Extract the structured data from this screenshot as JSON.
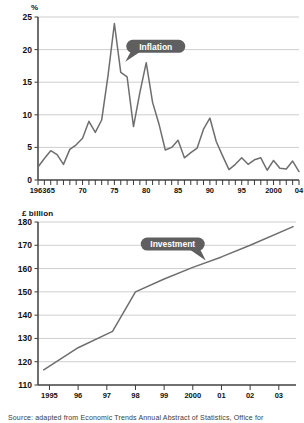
{
  "source_note": "Source: adapted from Economic Trends Annual Abstract of Statistics, Office for",
  "charts": {
    "inflation": {
      "unit_label": "%",
      "callout": "Inflation",
      "axis": {
        "y_ticks": [
          "0",
          "5",
          "10",
          "15",
          "20",
          "25"
        ],
        "x_ticks": [
          "1963",
          "65",
          "70",
          "75",
          "80",
          "85",
          "90",
          "95",
          "2000",
          "04"
        ]
      }
    },
    "investment": {
      "unit_label": "£ billion",
      "callout": "Investment",
      "axis": {
        "y_ticks": [
          "110",
          "120",
          "130",
          "140",
          "150",
          "160",
          "170",
          "180"
        ],
        "x_ticks": [
          "1995",
          "96",
          "97",
          "98",
          "99",
          "2000",
          "01",
          "02",
          "03"
        ]
      }
    }
  },
  "chart_data": [
    {
      "type": "line",
      "id": "inflation",
      "title": "Inflation",
      "xlabel": "",
      "ylabel": "%",
      "ylim": [
        0,
        25
      ],
      "xlim": [
        1963,
        2004
      ],
      "grid": true,
      "legend": "annotation-callout",
      "annotations": [
        {
          "text": "Inflation",
          "x": 1981.5,
          "y": 20.5
        }
      ],
      "x": [
        1963,
        1964,
        1965,
        1966,
        1967,
        1968,
        1969,
        1970,
        1971,
        1972,
        1973,
        1974,
        1975,
        1976,
        1977,
        1978,
        1979,
        1980,
        1981,
        1982,
        1983,
        1984,
        1985,
        1986,
        1987,
        1988,
        1989,
        1990,
        1991,
        1992,
        1993,
        1994,
        1995,
        1996,
        1997,
        1998,
        1999,
        2000,
        2001,
        2002,
        2003,
        2004
      ],
      "values": [
        2.0,
        3.3,
        4.5,
        3.9,
        2.4,
        4.7,
        5.4,
        6.4,
        9.0,
        7.3,
        9.2,
        16.0,
        24.0,
        16.5,
        15.8,
        8.2,
        13.4,
        18.0,
        11.9,
        8.6,
        4.6,
        5.0,
        6.1,
        3.4,
        4.2,
        4.9,
        7.8,
        9.5,
        5.9,
        3.7,
        1.6,
        2.4,
        3.4,
        2.4,
        3.1,
        3.4,
        1.5,
        3.0,
        1.8,
        1.7,
        2.9,
        1.3
      ],
      "tick_labels": {
        "1963": "1963",
        "1965": "65",
        "1970": "70",
        "1975": "75",
        "1980": "80",
        "1985": "85",
        "1990": "90",
        "1995": "95",
        "2000": "2000",
        "2004": "04"
      }
    },
    {
      "type": "line",
      "id": "investment",
      "title": "Investment",
      "xlabel": "",
      "ylabel": "£ billion",
      "ylim": [
        110,
        180
      ],
      "xlim": [
        1994.6,
        2003.6
      ],
      "grid": true,
      "legend": "annotation-callout",
      "annotations": [
        {
          "text": "Investment",
          "x": 1999.3,
          "y": 170.5
        }
      ],
      "x": [
        1994.8,
        1996.0,
        1997.2,
        1998.0,
        1999.0,
        2000.0,
        2001.0,
        2002.0,
        2003.5
      ],
      "values": [
        116.5,
        126.0,
        133.0,
        150.0,
        155.5,
        160.5,
        165.0,
        170.0,
        178.0
      ],
      "tick_labels": {
        "1995": "1995",
        "1996": "96",
        "1997": "97",
        "1998": "98",
        "1999": "99",
        "2000": "2000",
        "2001": "01",
        "2002": "02",
        "2003": "03"
      }
    }
  ]
}
